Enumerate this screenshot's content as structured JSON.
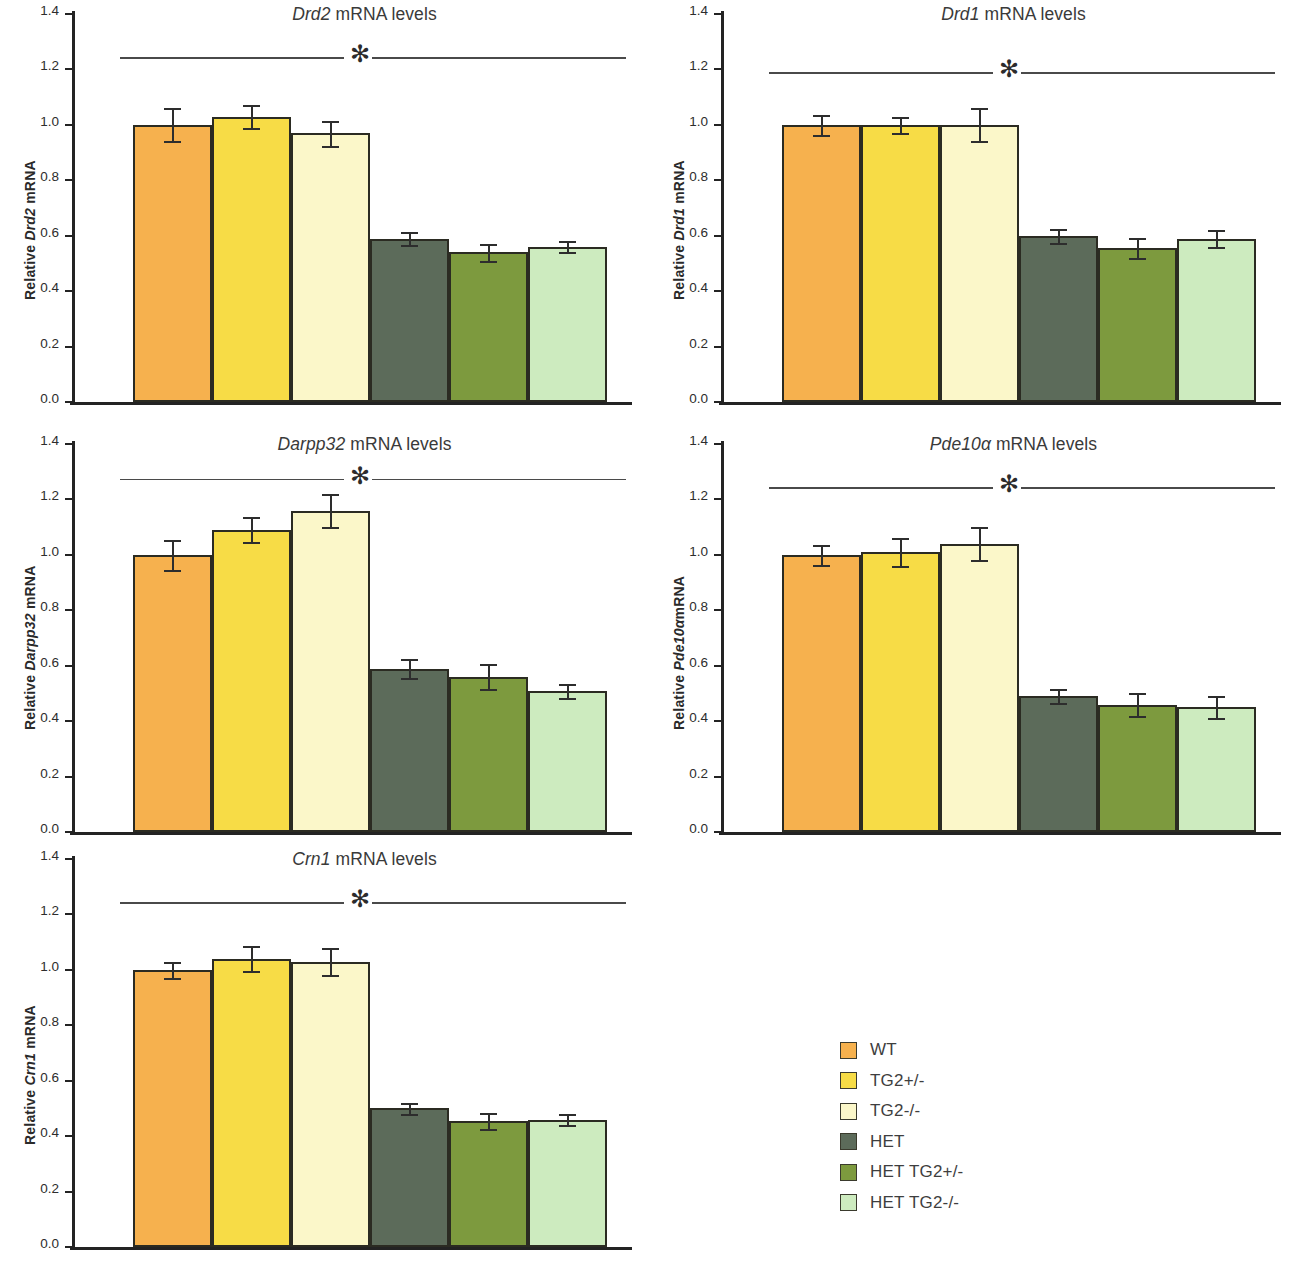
{
  "figure": {
    "groups": [
      "WT",
      "TG2+/-",
      "TG2-/-",
      "HET",
      "HET TG2+/-",
      "HET TG2-/-"
    ],
    "colors": [
      "#F6B14E",
      "#F7DC46",
      "#FBF7C9",
      "#5C6B5A",
      "#7D9A3E",
      "#CDEBBF"
    ],
    "y_axis": {
      "min": 0.0,
      "max": 1.4,
      "ticks": [
        "0.0",
        "0.2",
        "0.4",
        "0.6",
        "0.8",
        "1.0",
        "1.2",
        "1.4"
      ]
    },
    "significance_marker": "✻"
  },
  "legend": {
    "items": [
      {
        "label": "WT",
        "color": "#F6B14E"
      },
      {
        "label": "TG2+/-",
        "color": "#F7DC46"
      },
      {
        "label": "TG2-/-",
        "color": "#FBF7C9"
      },
      {
        "label": "HET",
        "color": "#5C6B5A"
      },
      {
        "label": "HET TG2+/-",
        "color": "#7D9A3E"
      },
      {
        "label": "HET TG2-/-",
        "color": "#CDEBBF"
      }
    ]
  },
  "panels": [
    {
      "id": "drd2",
      "gene": "Drd2",
      "title_suffix": " mRNA levels",
      "ylabel_prefix": "Relative ",
      "ylabel_gene": "Drd2",
      "ylabel_suffix": " mRNA"
    },
    {
      "id": "drd1",
      "gene": "Drd1",
      "title_suffix": " mRNA levels",
      "ylabel_prefix": "Relative ",
      "ylabel_gene": "Drd1",
      "ylabel_suffix": " mRNA"
    },
    {
      "id": "darpp32",
      "gene": "Darpp32",
      "title_suffix": " mRNA levels",
      "ylabel_prefix": "Relative ",
      "ylabel_gene": "Darpp32",
      "ylabel_suffix": " mRNA"
    },
    {
      "id": "pde10a",
      "gene": "Pde10α",
      "title_suffix": " mRNA levels",
      "ylabel_prefix": "Relative ",
      "ylabel_gene": "Pde10α",
      "ylabel_suffix": "mRNA"
    },
    {
      "id": "crn1",
      "gene": "Crn1",
      "title_suffix": " mRNA levels",
      "ylabel_prefix": "Relative ",
      "ylabel_gene": "Crn1",
      "ylabel_suffix": " mRNA"
    }
  ],
  "chart_data": [
    {
      "type": "bar",
      "id": "drd2",
      "title": "Drd2 mRNA levels",
      "xlabel": "",
      "ylabel": "Relative Drd2 mRNA",
      "ylim": [
        0.0,
        1.4
      ],
      "grid": false,
      "legend_position": "external-bottom-right",
      "categories": [
        "WT",
        "TG2+/-",
        "TG2-/-",
        "HET",
        "HET TG2+/-",
        "HET TG2-/-"
      ],
      "values": [
        1.0,
        1.03,
        0.97,
        0.59,
        0.54,
        0.56
      ],
      "errors": [
        0.06,
        0.04,
        0.045,
        0.025,
        0.03,
        0.02
      ],
      "annotations": [
        "* significant difference between TG2 genotypes and HET groups"
      ]
    },
    {
      "type": "bar",
      "id": "drd1",
      "title": "Drd1 mRNA levels",
      "xlabel": "",
      "ylabel": "Relative Drd1 mRNA",
      "ylim": [
        0.0,
        1.4
      ],
      "grid": false,
      "legend_position": "external-bottom-right",
      "categories": [
        "WT",
        "TG2+/-",
        "TG2-/-",
        "HET",
        "HET TG2+/-",
        "HET TG2-/-"
      ],
      "values": [
        1.0,
        1.0,
        1.0,
        0.6,
        0.555,
        0.59
      ],
      "errors": [
        0.035,
        0.03,
        0.06,
        0.025,
        0.035,
        0.03
      ],
      "annotations": [
        "* significant difference between TG2 genotypes and HET groups"
      ]
    },
    {
      "type": "bar",
      "id": "darpp32",
      "title": "Darpp32 mRNA levels",
      "xlabel": "",
      "ylabel": "Relative Darpp32 mRNA",
      "ylim": [
        0.0,
        1.4
      ],
      "grid": false,
      "legend_position": "external-bottom-right",
      "categories": [
        "WT",
        "TG2+/-",
        "TG2-/-",
        "HET",
        "HET TG2+/-",
        "HET TG2-/-"
      ],
      "values": [
        1.0,
        1.09,
        1.16,
        0.59,
        0.56,
        0.51
      ],
      "errors": [
        0.055,
        0.045,
        0.06,
        0.035,
        0.045,
        0.025
      ],
      "annotations": [
        "* significant difference between TG2 genotypes and HET groups"
      ]
    },
    {
      "type": "bar",
      "id": "pde10a",
      "title": "Pde10α mRNA levels",
      "xlabel": "",
      "ylabel": "Relative Pde10αmRNA",
      "ylim": [
        0.0,
        1.4
      ],
      "grid": false,
      "legend_position": "external-bottom-right",
      "categories": [
        "WT",
        "TG2+/-",
        "TG2-/-",
        "HET",
        "HET TG2+/-",
        "HET TG2-/-"
      ],
      "values": [
        1.0,
        1.01,
        1.04,
        0.49,
        0.46,
        0.45
      ],
      "errors": [
        0.035,
        0.05,
        0.06,
        0.025,
        0.04,
        0.04
      ],
      "annotations": [
        "* significant difference between TG2 genotypes and HET groups"
      ]
    },
    {
      "type": "bar",
      "id": "crn1",
      "title": "Crn1 mRNA levels",
      "xlabel": "",
      "ylabel": "Relative Crn1 mRNA",
      "ylim": [
        0.0,
        1.4
      ],
      "grid": false,
      "legend_position": "external-bottom-right",
      "categories": [
        "WT",
        "TG2+/-",
        "TG2-/-",
        "HET",
        "HET TG2+/-",
        "HET TG2-/-"
      ],
      "values": [
        1.0,
        1.04,
        1.03,
        0.5,
        0.455,
        0.46
      ],
      "errors": [
        0.03,
        0.045,
        0.05,
        0.02,
        0.03,
        0.02
      ],
      "annotations": [
        "* significant difference between TG2 genotypes and HET groups"
      ]
    }
  ]
}
